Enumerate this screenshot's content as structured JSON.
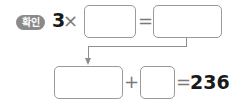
{
  "badge": {
    "label": "확인",
    "color": "#8a8a8a"
  },
  "row1": {
    "multiplicand": "3",
    "times_symbol": "×",
    "equals_symbol": "=",
    "box1_value": "",
    "box2_value": ""
  },
  "row2": {
    "box3_value": "",
    "plus_symbol": "+",
    "box4_value": "",
    "equals_symbol": "=",
    "result": "236"
  },
  "connector": {
    "from": "box2",
    "to": "box3",
    "icon": "down-arrow-icon"
  }
}
